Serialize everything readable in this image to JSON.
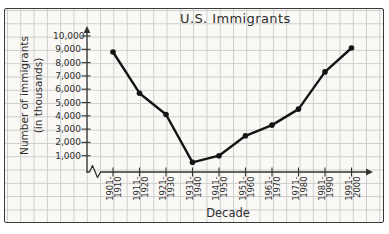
{
  "colors": {
    "page_background": "#ffffff",
    "paper": "#faf9f6",
    "grid": "#cbcdcc",
    "frame_border": "#3a3a3a",
    "axis_ink": "#333333",
    "data_ink": "#141414",
    "text_ink": "#2e2e2e"
  },
  "chart_data": {
    "type": "line",
    "title": "U.S. Immigrants",
    "xlabel": "Decade",
    "ylabel": "Number of immigrants (in thousands)",
    "ylabel_line1": "Number of immigrants",
    "ylabel_line2": "(in thousands)",
    "categories": [
      "1901-1910",
      "1911-1920",
      "1921-1930",
      "1931-1940",
      "1941-1950",
      "1951-1960",
      "1961-1970",
      "1971-1980",
      "1981-1990",
      "1991-2000"
    ],
    "values": [
      8800,
      5700,
      4100,
      500,
      1000,
      2500,
      3300,
      4500,
      7300,
      9100
    ],
    "unit": "thousands of immigrants",
    "y_tick_labels": [
      "10,000",
      "9,000",
      "8,000",
      "7,000",
      "6,000",
      "5,000",
      "4,000",
      "3,000",
      "2,000",
      "1,000"
    ],
    "ylim": [
      0,
      10000
    ],
    "y_tick_step": 1000,
    "grid": true,
    "legend": "none",
    "marker": "filled-circle",
    "x_axis_break_near_origin": true,
    "style": "hand-drawn line graph on graph paper"
  }
}
